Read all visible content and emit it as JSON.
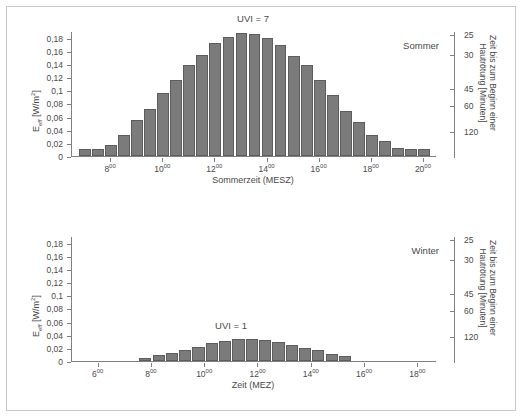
{
  "figure": {
    "border_color": "#c9c9c9",
    "bar_color": "#7b7b7b",
    "bar_edge_color": "#5d5d5d",
    "axis_color": "#808080",
    "text_color": "#4a4a4a"
  },
  "chart_data": [
    {
      "type": "bar",
      "panel": "summer",
      "title": "UVI = 7",
      "season_label": "Sommer",
      "xlabel": "Sommerzeit (MESZ)",
      "ylabel": "Eeff [W/m²]",
      "ylabel_base": "E",
      "ylabel_sub": "eff",
      "ylabel_unit": " [W/m",
      "ylabel_sup": "2",
      "ylabel_unit_end": "]",
      "y2label_line1": "Zeit bis zum Beginn einer",
      "y2label_line2": "Hautrötung [Minuten]",
      "grid": false,
      "legend": "none",
      "ylim": [
        0,
        0.19
      ],
      "yticks": [
        0,
        0.02,
        0.04,
        0.06,
        0.08,
        0.1,
        0.12,
        0.14,
        0.16,
        0.18
      ],
      "ytick_labels": [
        "0",
        "0,02",
        "0,04",
        "0,06",
        "0,08",
        "0,1",
        "0,12",
        "0,14",
        "0,16",
        "0,18"
      ],
      "y2ticks": [
        0.185,
        0.155,
        0.1035,
        0.0775,
        0.0385
      ],
      "y2tick_labels": [
        "25",
        "30",
        "45",
        "60",
        "120"
      ],
      "xlim": [
        6.5,
        20.5
      ],
      "xticks": [
        8,
        10,
        12,
        14,
        16,
        18,
        20
      ],
      "xtick_labels": [
        "8",
        "10",
        "12",
        "14",
        "16",
        "18",
        "20"
      ],
      "xtick_superscript": "00",
      "bar_width_hours": 0.5,
      "x": [
        7.0,
        7.5,
        8.0,
        8.5,
        9.0,
        9.5,
        10.0,
        10.5,
        11.0,
        11.5,
        12.0,
        12.5,
        13.0,
        13.5,
        14.0,
        14.5,
        15.0,
        15.5,
        16.0,
        16.5,
        17.0,
        17.5,
        18.0,
        18.5,
        19.0,
        19.5,
        20.0
      ],
      "values": [
        0.01,
        0.01,
        0.016,
        0.032,
        0.054,
        0.072,
        0.096,
        0.115,
        0.139,
        0.154,
        0.172,
        0.181,
        0.187,
        0.185,
        0.179,
        0.168,
        0.152,
        0.139,
        0.115,
        0.092,
        0.068,
        0.051,
        0.032,
        0.023,
        0.012,
        0.01,
        0.01
      ]
    },
    {
      "type": "bar",
      "panel": "winter",
      "title": "UVI = 1",
      "season_label": "Winter",
      "xlabel": "Zeit (MEZ)",
      "ylabel": "Eeff [W/m²]",
      "ylabel_base": "E",
      "ylabel_sub": "eff",
      "ylabel_unit": " [W/m",
      "ylabel_sup": "2",
      "ylabel_unit_end": "]",
      "y2label_line1": "Zeit bis zum Beginn einer",
      "y2label_line2": "Hautrötung [Minuten]",
      "grid": false,
      "legend": "none",
      "ylim": [
        0,
        0.19
      ],
      "yticks": [
        0,
        0.02,
        0.04,
        0.06,
        0.08,
        0.1,
        0.12,
        0.14,
        0.16,
        0.18
      ],
      "ytick_labels": [
        "0",
        "0,02",
        "0,04",
        "0,06",
        "0,08",
        "0,1",
        "0,12",
        "0,14",
        "0,16",
        "0,18"
      ],
      "y2ticks": [
        0.185,
        0.155,
        0.1035,
        0.0775,
        0.0385
      ],
      "y2tick_labels": [
        "25",
        "30",
        "45",
        "60",
        "120"
      ],
      "xlim": [
        5.0,
        18.7
      ],
      "xticks": [
        6,
        8,
        10,
        12,
        14,
        16,
        18
      ],
      "xtick_labels": [
        "6",
        "8",
        "10",
        "12",
        "14",
        "16",
        "18"
      ],
      "xtick_superscript": "00",
      "bar_width_hours": 0.5,
      "x": [
        7.75,
        8.25,
        8.75,
        9.25,
        9.75,
        10.25,
        10.75,
        11.25,
        11.75,
        12.25,
        12.75,
        13.25,
        13.75,
        14.25,
        14.75,
        15.25
      ],
      "values": [
        0.005,
        0.009,
        0.012,
        0.016,
        0.022,
        0.027,
        0.031,
        0.033,
        0.034,
        0.032,
        0.029,
        0.024,
        0.02,
        0.016,
        0.011,
        0.007
      ]
    }
  ]
}
